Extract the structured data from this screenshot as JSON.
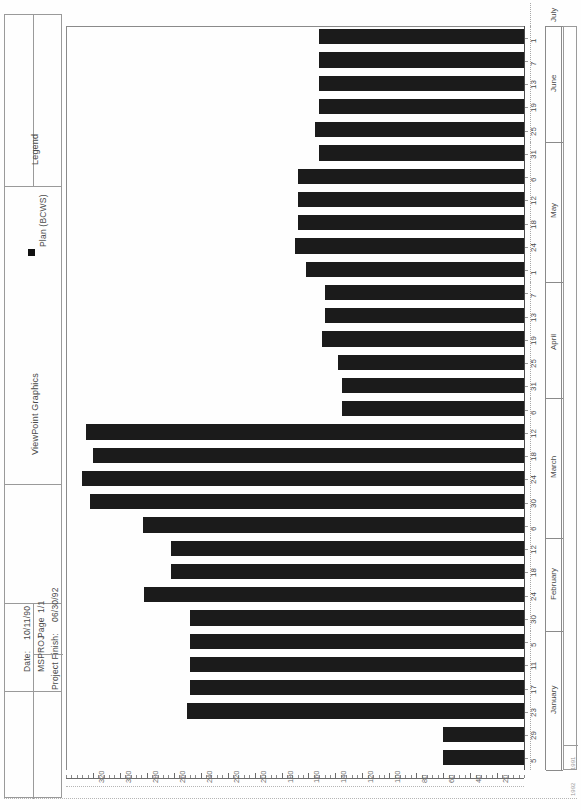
{
  "document": {
    "title": "ViewPoint Graphics",
    "legend_title": "Legend",
    "legend_items": [
      {
        "label": "Plan (BCWS)",
        "color": "#111111",
        "marker": "square"
      }
    ],
    "footer": {
      "date_label": "Date:",
      "date_value": "10/11/90",
      "page_label": "Page",
      "page_value": "1/1",
      "program": "MSPROJ",
      "project_finish_label": "Project Finish:",
      "project_finish_value": "06/30/92"
    }
  },
  "chart_data": {
    "type": "bar",
    "orientation": "horizontal",
    "title": "ViewPoint Graphics",
    "xlabel": "",
    "ylabel": "",
    "xlim": [
      0,
      340
    ],
    "xticks": [
      320,
      300,
      280,
      260,
      240,
      220,
      200,
      180,
      160,
      140,
      120,
      100,
      80,
      60,
      40,
      20
    ],
    "x_axis_reversed": true,
    "grid": false,
    "legend_position": "top-left",
    "series": [
      {
        "name": "Plan (BCWS)",
        "color": "#1b1b1b"
      }
    ],
    "categories": [
      "1",
      "7",
      "13",
      "19",
      "25",
      "31",
      "6",
      "12",
      "18",
      "24",
      "1",
      "7",
      "13",
      "19",
      "25",
      "31",
      "6",
      "12",
      "18",
      "24",
      "30",
      "6",
      "12",
      "18",
      "24",
      "30",
      "5",
      "11",
      "17",
      "23",
      "29",
      "5"
    ],
    "months": [
      {
        "name": "January",
        "year": "1991",
        "span": 6
      },
      {
        "name": "February",
        "year": "1991",
        "span": 4
      },
      {
        "name": "March",
        "year": "1991",
        "span": 6
      },
      {
        "name": "April",
        "year": "1991",
        "span": 5
      },
      {
        "name": "May",
        "year": "1991",
        "span": 6
      },
      {
        "name": "June",
        "year": "1991",
        "span": 5
      },
      {
        "name": "July",
        "year": "1991",
        "span": 1
      }
    ],
    "years": [
      "1991",
      "1992"
    ],
    "values": [
      152,
      152,
      152,
      152,
      155,
      152,
      168,
      168,
      168,
      170,
      162,
      148,
      148,
      150,
      138,
      135,
      135,
      325,
      320,
      328,
      322,
      283,
      262,
      262,
      282,
      248,
      248,
      248,
      248,
      250,
      60,
      60
    ]
  }
}
